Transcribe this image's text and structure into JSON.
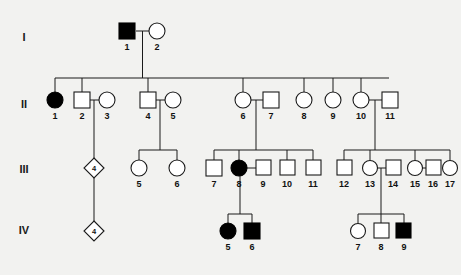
{
  "figure": {
    "kind": "pedigree-chart",
    "background_color": "#f2f2f0",
    "symbol_fill_unaffected": "#ffffff",
    "symbol_fill_affected": "#000000",
    "line_color": "#1a1a1a"
  },
  "generations": [
    {
      "label": "I",
      "label_x": 24,
      "label_y": 38
    },
    {
      "label": "II",
      "label_x": 24,
      "label_y": 105
    },
    {
      "label": "III",
      "label_x": 24,
      "label_y": 170
    },
    {
      "label": "IV",
      "label_x": 24,
      "label_y": 231
    }
  ],
  "individuals": [
    {
      "gen": "I",
      "id": "1",
      "shape": "square",
      "status": "affected",
      "cx": 127,
      "cy": 31,
      "label_x": 127,
      "label_y": 47
    },
    {
      "gen": "I",
      "id": "2",
      "shape": "circle",
      "status": "unaffected",
      "cx": 156,
      "cy": 31,
      "label_x": 156,
      "label_y": 47
    },
    {
      "gen": "II",
      "id": "1",
      "shape": "circle",
      "status": "affected",
      "cx": 55,
      "cy": 100,
      "label_x": 55,
      "label_y": 117
    },
    {
      "gen": "II",
      "id": "2",
      "shape": "square",
      "status": "unaffected",
      "cx": 82,
      "cy": 100,
      "label_x": 82,
      "label_y": 117
    },
    {
      "gen": "II",
      "id": "3",
      "shape": "circle",
      "status": "unaffected",
      "cx": 106,
      "cy": 100,
      "label_x": 106,
      "label_y": 117
    },
    {
      "gen": "II",
      "id": "4",
      "shape": "square",
      "status": "unaffected",
      "cx": 148,
      "cy": 100,
      "label_x": 148,
      "label_y": 117
    },
    {
      "gen": "II",
      "id": "5",
      "shape": "circle",
      "status": "unaffected",
      "cx": 172,
      "cy": 100,
      "label_x": 172,
      "label_y": 117
    },
    {
      "gen": "II",
      "id": "6",
      "shape": "circle",
      "status": "unaffected",
      "cx": 243,
      "cy": 100,
      "label_x": 243,
      "label_y": 117
    },
    {
      "gen": "II",
      "id": "7",
      "shape": "square",
      "status": "unaffected",
      "cx": 270,
      "cy": 100,
      "label_x": 270,
      "label_y": 117
    },
    {
      "gen": "II",
      "id": "8",
      "shape": "circle",
      "status": "unaffected",
      "cx": 304,
      "cy": 100,
      "label_x": 304,
      "label_y": 117
    },
    {
      "gen": "II",
      "id": "9",
      "shape": "circle",
      "status": "unaffected",
      "cx": 333,
      "cy": 100,
      "label_x": 333,
      "label_y": 117
    },
    {
      "gen": "II",
      "id": "10",
      "shape": "circle",
      "status": "unaffected",
      "cx": 361,
      "cy": 100,
      "label_x": 361,
      "label_y": 117
    },
    {
      "gen": "II",
      "id": "11",
      "shape": "square",
      "status": "unaffected",
      "cx": 389,
      "cy": 100,
      "label_x": 389,
      "label_y": 117
    },
    {
      "gen": "III",
      "id": "4",
      "shape": "diamond",
      "status": "unknown",
      "cx": 94,
      "cy": 168,
      "label_x": 94,
      "label_y": 168,
      "inner_text": "4"
    },
    {
      "gen": "III",
      "id": "5",
      "shape": "circle",
      "status": "unaffected",
      "cx": 139,
      "cy": 168,
      "label_x": 139,
      "label_y": 185
    },
    {
      "gen": "III",
      "id": "6",
      "shape": "circle",
      "status": "unaffected",
      "cx": 177,
      "cy": 168,
      "label_x": 177,
      "label_y": 185
    },
    {
      "gen": "III",
      "id": "7",
      "shape": "square",
      "status": "unaffected",
      "cx": 214,
      "cy": 168,
      "label_x": 214,
      "label_y": 185
    },
    {
      "gen": "III",
      "id": "8",
      "shape": "circle",
      "status": "affected",
      "cx": 239,
      "cy": 168,
      "label_x": 239,
      "label_y": 185
    },
    {
      "gen": "III",
      "id": "9",
      "shape": "square",
      "status": "unaffected",
      "cx": 262,
      "cy": 168,
      "label_x": 262,
      "label_y": 185
    },
    {
      "gen": "III",
      "id": "10",
      "shape": "square",
      "status": "unaffected",
      "cx": 287,
      "cy": 168,
      "label_x": 287,
      "label_y": 185
    },
    {
      "gen": "III",
      "id": "11",
      "shape": "square",
      "status": "unaffected",
      "cx": 313,
      "cy": 168,
      "label_x": 313,
      "label_y": 185
    },
    {
      "gen": "III",
      "id": "12",
      "shape": "square",
      "status": "unaffected",
      "cx": 344,
      "cy": 168,
      "label_x": 344,
      "label_y": 185
    },
    {
      "gen": "III",
      "id": "13",
      "shape": "circle",
      "status": "unaffected",
      "cx": 370,
      "cy": 168,
      "label_x": 370,
      "label_y": 185
    },
    {
      "gen": "III",
      "id": "14",
      "shape": "square",
      "status": "unaffected",
      "cx": 393,
      "cy": 168,
      "label_x": 393,
      "label_y": 185
    },
    {
      "gen": "III",
      "id": "15",
      "shape": "circle",
      "status": "unaffected",
      "cx": 415,
      "cy": 168,
      "label_x": 415,
      "label_y": 185
    },
    {
      "gen": "III",
      "id": "16",
      "shape": "square",
      "status": "unaffected",
      "cx": 432,
      "cy": 168,
      "label_x": 432,
      "label_y": 185
    },
    {
      "gen": "III",
      "id": "17",
      "shape": "circle",
      "status": "unaffected",
      "cx": 450,
      "cy": 168,
      "label_x": 450,
      "label_y": 185
    },
    {
      "gen": "IV",
      "id": "4",
      "shape": "diamond",
      "status": "unknown",
      "cx": 94,
      "cy": 231,
      "label_x": 94,
      "label_y": 231,
      "inner_text": "4"
    },
    {
      "gen": "IV",
      "id": "5",
      "shape": "circle",
      "status": "affected",
      "cx": 228,
      "cy": 231,
      "label_x": 228,
      "label_y": 248
    },
    {
      "gen": "IV",
      "id": "6",
      "shape": "square",
      "status": "affected",
      "cx": 252,
      "cy": 231,
      "label_x": 252,
      "label_y": 248
    },
    {
      "gen": "IV",
      "id": "7",
      "shape": "circle",
      "status": "unaffected",
      "cx": 358,
      "cy": 231,
      "label_x": 358,
      "label_y": 248
    },
    {
      "gen": "IV",
      "id": "8",
      "shape": "square",
      "status": "unaffected",
      "cx": 381,
      "cy": 231,
      "label_x": 381,
      "label_y": 248
    },
    {
      "gen": "IV",
      "id": "9",
      "shape": "square",
      "status": "affected",
      "cx": 404,
      "cy": 231,
      "label_x": 404,
      "label_y": 248
    }
  ],
  "connectors": {
    "mating_lines": [
      {
        "name": "I-1 x I-2",
        "x1": 136,
        "y1": 31,
        "x2": 148,
        "y2": 31
      },
      {
        "name": "II-2 x II-3",
        "x1": 89,
        "y1": 100,
        "x2": 99,
        "y2": 100
      },
      {
        "name": "II-4 x II-5",
        "x1": 155,
        "y1": 100,
        "x2": 165,
        "y2": 100
      },
      {
        "name": "II-6 x II-7",
        "x1": 250,
        "y1": 100,
        "x2": 263,
        "y2": 100
      },
      {
        "name": "II-10 x II-11",
        "x1": 368,
        "y1": 100,
        "x2": 382,
        "y2": 100
      },
      {
        "name": "III-8 x III-9",
        "x1": 246,
        "y1": 168,
        "x2": 255,
        "y2": 168
      },
      {
        "name": "III-13 x III-14",
        "x1": 377,
        "y1": 168,
        "x2": 386,
        "y2": 168
      },
      {
        "name": "III-15 x III-16",
        "x1": 422,
        "y1": 168,
        "x2": 425,
        "y2": 168
      }
    ],
    "sibship_bars": [
      {
        "name": "gen-II-sibship",
        "y": 78,
        "x1": 55,
        "x2": 389
      },
      {
        "name": "gen-III-sibship-left",
        "y": 150,
        "x1": 139,
        "x2": 177
      },
      {
        "name": "gen-III-sibship-mid",
        "y": 150,
        "x1": 214,
        "x2": 313
      },
      {
        "name": "gen-III-sibship-right",
        "y": 150,
        "x1": 344,
        "x2": 450
      },
      {
        "name": "gen-IV-sibship-mid",
        "y": 214,
        "x1": 228,
        "x2": 252
      },
      {
        "name": "gen-IV-sibship-right",
        "y": 214,
        "x1": 358,
        "x2": 404
      }
    ]
  }
}
